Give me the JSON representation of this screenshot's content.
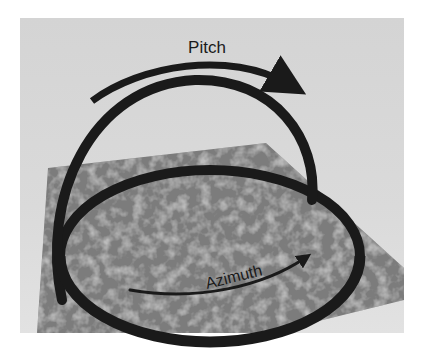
{
  "figure": {
    "labels": {
      "pitch": "Pitch",
      "azimuth": "Azimuth"
    },
    "colors": {
      "background": "#ffffff",
      "canvas": "#d6d6d6",
      "plane": "#7a7a7a",
      "ring": "#1a1a1a",
      "text": "#1a1a1a"
    }
  }
}
